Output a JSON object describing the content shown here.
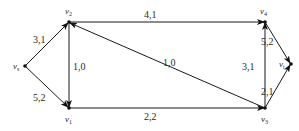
{
  "diagram": {
    "type": "flow-network",
    "nodes": [
      {
        "id": "vs",
        "label": "v",
        "sub": "s",
        "x": 25,
        "y": 66
      },
      {
        "id": "v2",
        "label": "v",
        "sub": "2",
        "x": 69,
        "y": 22
      },
      {
        "id": "v1",
        "label": "v",
        "sub": "1",
        "x": 69,
        "y": 108
      },
      {
        "id": "v4",
        "label": "v",
        "sub": "4",
        "x": 265,
        "y": 22
      },
      {
        "id": "v3",
        "label": "v",
        "sub": "3",
        "x": 265,
        "y": 108
      },
      {
        "id": "vt",
        "label": "v",
        "sub": "t",
        "x": 291,
        "y": 64
      }
    ],
    "edges": [
      {
        "from": "vs",
        "to": "v2",
        "label": "3,1"
      },
      {
        "from": "vs",
        "to": "v1",
        "label": "5,2"
      },
      {
        "from": "v2",
        "to": "v1",
        "label": "1,0"
      },
      {
        "from": "v2",
        "to": "v4",
        "label": "4,1"
      },
      {
        "from": "v3",
        "to": "v2",
        "label": "1,0"
      },
      {
        "from": "v1",
        "to": "v3",
        "label": "2,2"
      },
      {
        "from": "v3",
        "to": "v4",
        "label": "3,1"
      },
      {
        "from": "v4",
        "to": "vt",
        "label": "5,2"
      },
      {
        "from": "v3",
        "to": "vt",
        "label": "2,1"
      }
    ]
  },
  "labels": {
    "vs": {
      "main": "v",
      "sub": "s"
    },
    "v1": {
      "main": "v",
      "sub": "1"
    },
    "v2": {
      "main": "v",
      "sub": "2"
    },
    "v3": {
      "main": "v",
      "sub": "3"
    },
    "v4": {
      "main": "v",
      "sub": "4"
    },
    "vt": {
      "main": "v",
      "sub": "t"
    },
    "e_vs_v2": "3,1",
    "e_vs_v1": "5,2",
    "e_v2_v1": "1,0",
    "e_v2_v4": "4,1",
    "e_v3_v2": "1,0",
    "e_v1_v3": "2,2",
    "e_v3_v4": "3,1",
    "e_v4_vt": "5,2",
    "e_v3_vt": "2,1"
  }
}
